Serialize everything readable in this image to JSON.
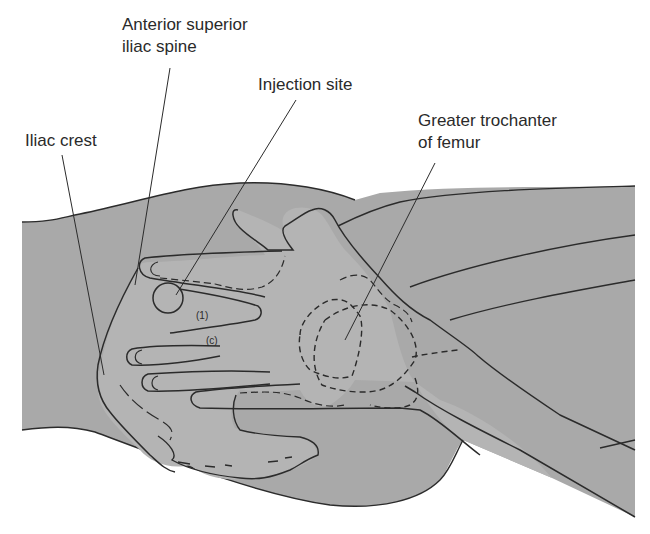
{
  "figure": {
    "labels": {
      "asis": {
        "line1": "Anterior superior",
        "line2": "iliac spine"
      },
      "injection_site": "Injection site",
      "iliac_crest": "Iliac crest",
      "greater_trochanter": {
        "line1": "Greater trochanter",
        "line2": "of femur"
      }
    },
    "finger_marks": {
      "index": "(1)",
      "middle": "(c)"
    },
    "colors": {
      "body_fill": "#a9a9a9",
      "hand_fill": "#b4b4b4",
      "outline": "#2b2b2b",
      "text": "#2a2a2a",
      "background": "#ffffff"
    }
  }
}
